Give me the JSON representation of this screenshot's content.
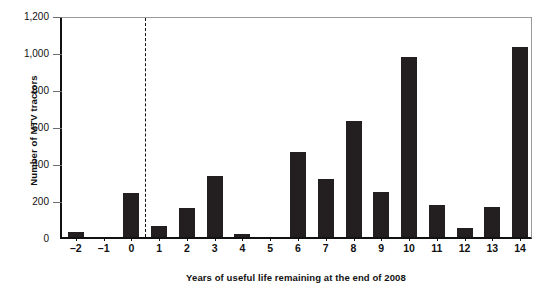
{
  "chart_data": {
    "type": "bar",
    "title": "",
    "xlabel": "Years of useful life remaining at the end of 2008",
    "ylabel": "Number of MTV tractors",
    "categories": [
      "–2",
      "–1",
      "0",
      "1",
      "2",
      "3",
      "4",
      "5",
      "6",
      "7",
      "8",
      "9",
      "10",
      "11",
      "12",
      "13",
      "14"
    ],
    "values": [
      25,
      0,
      240,
      60,
      155,
      330,
      15,
      0,
      460,
      315,
      625,
      245,
      975,
      175,
      50,
      160,
      1025
    ],
    "ylim": [
      0,
      1200
    ],
    "yticks": [
      0,
      200,
      400,
      600,
      800,
      1000,
      1200
    ],
    "ytick_labels": [
      "0",
      "200",
      "400",
      "600",
      "800",
      "1,000",
      "1,200"
    ],
    "grid": false,
    "legend": null,
    "annotations": [
      {
        "kind": "vertical-dashed-line",
        "between_categories": [
          "0",
          "1"
        ],
        "x_value": 0.5
      }
    ],
    "bar_color": "#231f20"
  }
}
